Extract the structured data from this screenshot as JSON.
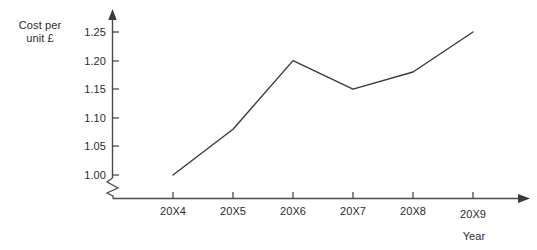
{
  "chart_data": {
    "type": "line",
    "title": "",
    "xlabel": "Year",
    "ylabel": "Cost per unit £",
    "categories": [
      "20X4",
      "20X5",
      "20X6",
      "20X7",
      "20X8",
      "20X9"
    ],
    "values": [
      1.0,
      1.08,
      1.2,
      1.15,
      1.18,
      1.25
    ],
    "series": [
      {
        "name": "Cost per unit",
        "values": [
          1.0,
          1.08,
          1.2,
          1.15,
          1.18,
          1.25
        ]
      }
    ],
    "ylim": [
      1.0,
      1.25
    ],
    "ytick_labels": [
      "1.00",
      "1.05",
      "1.10",
      "1.15",
      "1.20",
      "1.25"
    ],
    "ytick_values": [
      1.0,
      1.05,
      1.1,
      1.15,
      1.2,
      1.25
    ],
    "grid": false,
    "legend": "none",
    "axis_break": true,
    "line_color": "#3a3a3a",
    "axis_color": "#4a4a4a"
  },
  "labels": {
    "y_axis_title": "Cost per\nunit £",
    "x_axis_title": "Year"
  }
}
